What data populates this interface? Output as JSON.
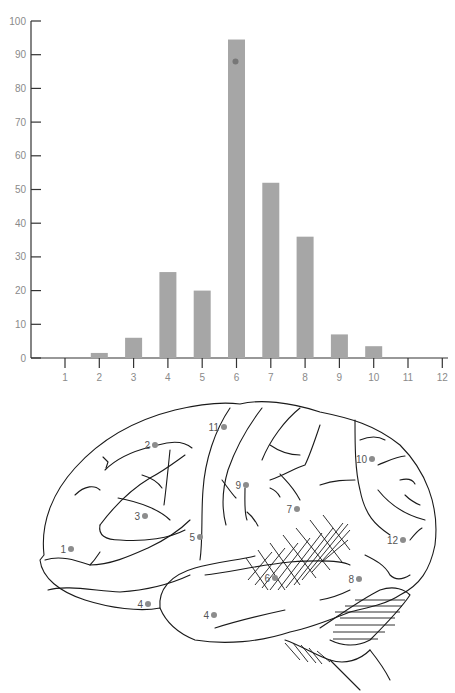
{
  "chart_data": {
    "type": "bar",
    "title": "",
    "xlabel": "",
    "ylabel": "",
    "categories": [
      "1",
      "2",
      "3",
      "4",
      "5",
      "6",
      "7",
      "8",
      "9",
      "10",
      "11",
      "12"
    ],
    "values": [
      0,
      1.5,
      6,
      25.5,
      20,
      94.5,
      52,
      36,
      7,
      3.5,
      0,
      0
    ],
    "annotations": [
      {
        "type": "dot",
        "x": "6",
        "y": 88
      }
    ],
    "ylim": [
      0,
      100
    ],
    "yticks": [
      0,
      10,
      20,
      30,
      40,
      50,
      60,
      70,
      80,
      90,
      100
    ],
    "xticks": [
      "1",
      "2",
      "3",
      "4",
      "5",
      "6",
      "7",
      "8",
      "9",
      "10",
      "11",
      "12"
    ],
    "grid": false,
    "legend": null,
    "bar_color": "#a6a6a6",
    "dot_color": "#777777"
  },
  "diagram": {
    "type": "brain-lateral-view",
    "site_labels": [
      {
        "label": "1",
        "x": 71,
        "y": 549
      },
      {
        "label": "2",
        "x": 155,
        "y": 445
      },
      {
        "label": "3",
        "x": 145,
        "y": 516
      },
      {
        "label": "4",
        "x": 148,
        "y": 604
      },
      {
        "label": "4",
        "x": 214,
        "y": 615
      },
      {
        "label": "5",
        "x": 200,
        "y": 537
      },
      {
        "label": "6",
        "x": 275,
        "y": 578
      },
      {
        "label": "7",
        "x": 297,
        "y": 509
      },
      {
        "label": "8",
        "x": 359,
        "y": 579
      },
      {
        "label": "9",
        "x": 246,
        "y": 485
      },
      {
        "label": "10",
        "x": 372,
        "y": 459
      },
      {
        "label": "11",
        "x": 224,
        "y": 427
      },
      {
        "label": "12",
        "x": 403,
        "y": 540
      }
    ],
    "dot_color": "#8c8c8c"
  }
}
